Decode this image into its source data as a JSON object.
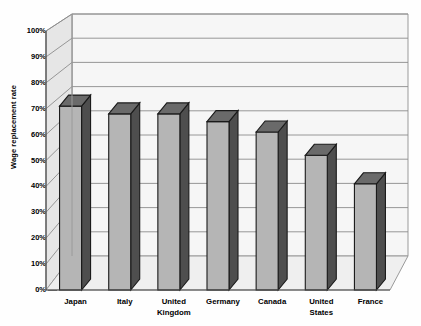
{
  "chart_data": {
    "type": "bar",
    "title": "",
    "subtitle": "",
    "xlabel": "",
    "ylabel": "Wage replacement rate",
    "categories": [
      "Japan",
      "Italy",
      "United Kingdom",
      "Germany",
      "Canada",
      "United States",
      "France"
    ],
    "values": [
      71,
      68,
      68,
      65,
      61,
      52,
      41
    ],
    "value_unit": "%",
    "ylim": [
      0,
      100
    ],
    "ytick_values": [
      0,
      10,
      20,
      30,
      40,
      50,
      60,
      70,
      80,
      90,
      100
    ],
    "ytick_labels": [
      "0%",
      "10%",
      "20%",
      "30%",
      "40%",
      "50%",
      "60%",
      "70%",
      "80%",
      "90%",
      "100%"
    ],
    "grid": true,
    "grid_axis": "y",
    "legend": false,
    "legend_position": "none",
    "series": [
      {
        "name": "Wage replacement rate",
        "values": [
          71,
          68,
          68,
          65,
          61,
          52,
          41
        ]
      }
    ],
    "style": {
      "three_d": true,
      "bar_front_color": "#b5b5b5",
      "bar_side_color": "#4e4e4e",
      "bar_top_color": "#6a6a6a",
      "bar_edge_color": "#1a1a1a",
      "back_wall_color": "#f4f4f4",
      "side_wall_color": "#e3e3e3",
      "floor_color": "#ededed",
      "grid_color": "#8c8c8c",
      "axis_color": "#4a4a4a",
      "text_color": "#000000",
      "background_color": "#ffffff"
    }
  },
  "labels": {
    "categories": [
      "Japan",
      "Italy",
      "United Kingdom",
      "Germany",
      "Canada",
      "United States",
      "France"
    ],
    "cat_lines": [
      [
        "Japan"
      ],
      [
        "Italy"
      ],
      [
        "United",
        "Kingdom"
      ],
      [
        "Germany"
      ],
      [
        "Canada"
      ],
      [
        "United",
        "States"
      ],
      [
        "France"
      ]
    ],
    "y_axis_title": "Wage replacement rate",
    "yticks": [
      "100%",
      "90%",
      "80%",
      "70%",
      "60%",
      "50%",
      "40%",
      "30%",
      "20%",
      "10%",
      "0%"
    ]
  }
}
